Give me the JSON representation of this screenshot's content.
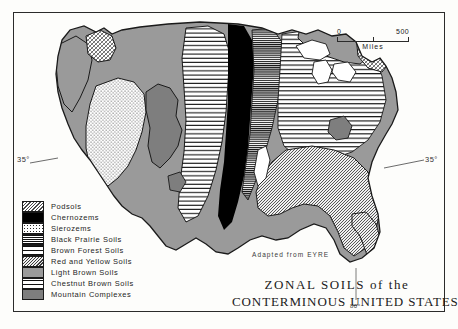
{
  "title": {
    "line1": "ZONAL SOILS of the",
    "line2": "CONTERMINOUS UNITED STATES"
  },
  "credit": "Adapted from EYRE",
  "scale": {
    "min_label": "0",
    "max_label": "500",
    "units": "Miles"
  },
  "graticule": {
    "lat_west": "35°",
    "lat_east": "35°",
    "lon_south": "80°"
  },
  "legend": {
    "items": [
      {
        "label": "Podsols",
        "pattern": "cross-hatch-grey",
        "swatch_class": "sw-podsol"
      },
      {
        "label": "Chernozems",
        "pattern": "solid-black",
        "swatch_class": "sw-chernozem"
      },
      {
        "label": "Sierozems",
        "pattern": "fine-stipple-dots",
        "swatch_class": "sw-sierozem"
      },
      {
        "label": "Black Prairie Soils",
        "pattern": "dense-horizontal-lines",
        "swatch_class": "sw-blackprairie"
      },
      {
        "label": "Brown Forest Soils",
        "pattern": "wide-horizontal-lines",
        "swatch_class": "sw-brownforest"
      },
      {
        "label": "Red and Yellow Soils",
        "pattern": "fine-diagonal-hatch",
        "swatch_class": "sw-redyellow"
      },
      {
        "label": "Light Brown Soils",
        "pattern": "solid-mid-grey",
        "swatch_class": "sw-lightbrown"
      },
      {
        "label": "Chestnut Brown Soils",
        "pattern": "sparse-horizontal-lines",
        "swatch_class": "sw-chestnut"
      },
      {
        "label": "Mountain Complexes",
        "pattern": "solid-dark-grey",
        "swatch_class": "sw-mountain"
      }
    ]
  },
  "colors": {
    "ink": "#1a1a1a",
    "paper": "#fdfdfb",
    "chernozem": "#000000",
    "light_brown": "#9a9a9a",
    "mountain": "#7e7e7e"
  },
  "map": {
    "region": "Conterminous United States",
    "projection_note": "soil zone choropleth with engraved fill patterns"
  }
}
